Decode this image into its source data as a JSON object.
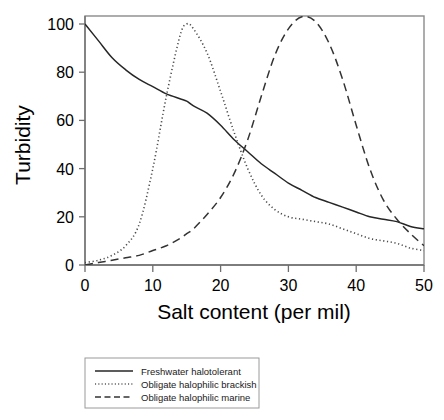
{
  "chart_data": {
    "type": "line",
    "title": "",
    "xlabel": "Salt content (per mil)",
    "ylabel": "Turbidity",
    "xlim": [
      0,
      50
    ],
    "ylim": [
      0,
      105
    ],
    "xticks": [
      0,
      10,
      20,
      30,
      40,
      50
    ],
    "yticks": [
      0,
      20,
      40,
      60,
      80,
      100
    ],
    "xtick_labels": [
      "0",
      "10",
      "20",
      "30",
      "40",
      "50"
    ],
    "ytick_labels": [
      "0",
      "20",
      "40",
      "60",
      "80",
      "100"
    ],
    "grid": false,
    "legend_position": "below-plot",
    "x": [
      0,
      2,
      4,
      6,
      8,
      10,
      12,
      14,
      15,
      16,
      18,
      20,
      22,
      24,
      26,
      28,
      30,
      32,
      34,
      36,
      38,
      40,
      42,
      44,
      46,
      48,
      50
    ],
    "series": [
      {
        "name": "Freshwater halotolerant",
        "style": "solid",
        "color": "#262626",
        "values": [
          100,
          93,
          86,
          81,
          77,
          74,
          71,
          69,
          68,
          66,
          63,
          58,
          52,
          47,
          42,
          38,
          34,
          31,
          28,
          26,
          24,
          22,
          20,
          19,
          18,
          16,
          15
        ]
      },
      {
        "name": "Obligate halophilic brackish",
        "style": "dotted",
        "color": "#4a4a4a",
        "values": [
          1,
          2,
          4,
          8,
          17,
          40,
          70,
          95,
          100,
          98,
          88,
          72,
          55,
          40,
          29,
          23,
          20,
          19,
          18,
          17,
          15,
          13,
          11,
          10,
          9,
          7,
          6
        ]
      },
      {
        "name": "Obligate halophilic marine",
        "style": "dashed",
        "color": "#333333",
        "values": [
          0,
          1,
          2,
          3,
          4,
          6,
          8,
          11,
          13,
          15,
          21,
          28,
          38,
          52,
          70,
          87,
          98,
          103,
          101,
          92,
          77,
          58,
          40,
          27,
          19,
          13,
          8
        ]
      }
    ],
    "legend": [
      {
        "label": "Freshwater halotolerant",
        "style": "solid"
      },
      {
        "label": "Obligate halophilic brackish",
        "style": "dotted"
      },
      {
        "label": "Obligate halophilic marine",
        "style": "dashed"
      }
    ]
  }
}
